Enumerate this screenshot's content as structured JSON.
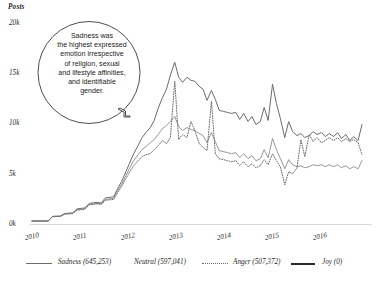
{
  "chart_data": {
    "type": "line",
    "title": "",
    "xlabel": "",
    "ylabel": "Posts",
    "yunit_label": "Posts",
    "ylim": [
      0,
      20000
    ],
    "xlim": [
      2010,
      2016.75
    ],
    "grid": false,
    "legend_position": "bottom",
    "yticks": [
      "0k",
      "5k",
      "10k",
      "15k",
      "20k"
    ],
    "ytick_values": [
      0,
      5000,
      10000,
      15000,
      20000
    ],
    "xticks": [
      "2010",
      "2011",
      "2012",
      "2013",
      "2014",
      "2015",
      "2016"
    ],
    "xtick_values": [
      2010,
      2011,
      2012,
      2013,
      2014,
      2015,
      2016
    ],
    "annotations": [
      {
        "name": "callout",
        "text": "Sadness was the highest expressed emotion irrespective of religion, sexual and lifestyle affinities, and identifiable gender.",
        "lines": [
          "Sadness was",
          "the highest expressed",
          "emotion irrespective",
          "of religion, sexual",
          "and lifestyle affinities,",
          "and identifiable",
          "gender."
        ]
      }
    ],
    "series": [
      {
        "name": "Sadness",
        "label": "Sadness (645,253)",
        "total": 645253,
        "style": "solid",
        "color": "#6b6b6b",
        "width": 1.0,
        "x": [
          2010.0,
          2010.08,
          2010.17,
          2010.25,
          2010.33,
          2010.42,
          2010.5,
          2010.58,
          2010.67,
          2010.75,
          2010.83,
          2010.92,
          2011.0,
          2011.08,
          2011.17,
          2011.25,
          2011.33,
          2011.42,
          2011.5,
          2011.58,
          2011.67,
          2011.75,
          2011.83,
          2011.92,
          2012.0,
          2012.08,
          2012.17,
          2012.25,
          2012.33,
          2012.42,
          2012.5,
          2012.58,
          2012.67,
          2012.75,
          2012.83,
          2012.92,
          2013.0,
          2013.08,
          2013.17,
          2013.25,
          2013.33,
          2013.42,
          2013.5,
          2013.58,
          2013.67,
          2013.75,
          2013.83,
          2013.92,
          2014.0,
          2014.08,
          2014.17,
          2014.25,
          2014.33,
          2014.42,
          2014.5,
          2014.58,
          2014.67,
          2014.75,
          2014.83,
          2014.92,
          2015.0,
          2015.08,
          2015.17,
          2015.25,
          2015.33,
          2015.42,
          2015.5,
          2015.58,
          2015.67,
          2015.75,
          2015.83,
          2015.92,
          2016.0,
          2016.08,
          2016.17,
          2016.25,
          2016.33,
          2016.42,
          2016.5,
          2016.58,
          2016.67,
          2016.75
        ],
        "values": [
          300,
          310,
          300,
          305,
          300,
          760,
          780,
          790,
          1050,
          1080,
          1100,
          1500,
          1550,
          1600,
          2050,
          2100,
          2150,
          2100,
          2600,
          2650,
          2700,
          3500,
          4200,
          5200,
          6100,
          7000,
          7800,
          8600,
          9100,
          9600,
          10300,
          11500,
          12600,
          13400,
          14800,
          16100,
          14600,
          14100,
          14600,
          14300,
          14200,
          13700,
          13400,
          12300,
          13300,
          12400,
          11300,
          11200,
          11100,
          11000,
          11100,
          10400,
          11000,
          10200,
          10700,
          9900,
          10200,
          11600,
          10300,
          13900,
          12000,
          10500,
          8600,
          10200,
          9200,
          8800,
          9000,
          8600,
          8800,
          9200,
          8900,
          9100,
          8700,
          9000,
          8700,
          9100,
          8500,
          8900,
          8300,
          8700,
          8300,
          9900
        ]
      },
      {
        "name": "Neutral",
        "label": "Neutral (597,041)",
        "total": 597041,
        "style": "solid",
        "color": "#8a8a8a",
        "width": 0.9,
        "x": [
          2010.0,
          2010.08,
          2010.17,
          2010.25,
          2010.33,
          2010.42,
          2010.5,
          2010.58,
          2010.67,
          2010.75,
          2010.83,
          2010.92,
          2011.0,
          2011.08,
          2011.17,
          2011.25,
          2011.33,
          2011.42,
          2011.5,
          2011.58,
          2011.67,
          2011.75,
          2011.83,
          2011.92,
          2012.0,
          2012.08,
          2012.17,
          2012.25,
          2012.33,
          2012.42,
          2012.5,
          2012.58,
          2012.67,
          2012.75,
          2012.83,
          2012.92,
          2013.0,
          2013.08,
          2013.17,
          2013.25,
          2013.33,
          2013.42,
          2013.5,
          2013.58,
          2013.67,
          2013.75,
          2013.83,
          2013.92,
          2014.0,
          2014.08,
          2014.17,
          2014.25,
          2014.33,
          2014.42,
          2014.5,
          2014.58,
          2014.67,
          2014.75,
          2014.83,
          2014.92,
          2015.0,
          2015.08,
          2015.17,
          2015.25,
          2015.33,
          2015.42,
          2015.5,
          2015.58,
          2015.67,
          2015.75,
          2015.83,
          2015.92,
          2016.0,
          2016.08,
          2016.17,
          2016.25,
          2016.33,
          2016.42,
          2016.5,
          2016.58,
          2016.67,
          2016.75
        ],
        "values": [
          290,
          300,
          295,
          300,
          295,
          740,
          760,
          770,
          1000,
          1030,
          1060,
          1420,
          1470,
          1520,
          1950,
          2000,
          2050,
          2000,
          2450,
          2500,
          2560,
          3300,
          3900,
          4800,
          5600,
          6300,
          6900,
          7400,
          7700,
          8100,
          8400,
          8900,
          9500,
          9800,
          10200,
          10700,
          9700,
          9300,
          9600,
          9400,
          9300,
          9000,
          8800,
          8100,
          9100,
          8200,
          7300,
          7200,
          7100,
          7000,
          7100,
          6600,
          7000,
          6500,
          6800,
          6300,
          6500,
          7400,
          6600,
          8500,
          7400,
          6500,
          5500,
          6400,
          5900,
          5700,
          5800,
          5600,
          5700,
          5900,
          5800,
          5900,
          5700,
          5900,
          5700,
          5900,
          5600,
          5800,
          5500,
          5700,
          5500,
          6300
        ]
      },
      {
        "name": "Anger",
        "label": "Anger (507,372)",
        "total": 507372,
        "style": "dotted",
        "color": "#6b6b6b",
        "width": 1.0,
        "x": [
          2010.0,
          2010.08,
          2010.17,
          2010.25,
          2010.33,
          2010.42,
          2010.5,
          2010.58,
          2010.67,
          2010.75,
          2010.83,
          2010.92,
          2011.0,
          2011.08,
          2011.17,
          2011.25,
          2011.33,
          2011.42,
          2011.5,
          2011.58,
          2011.67,
          2011.75,
          2011.83,
          2011.92,
          2012.0,
          2012.08,
          2012.17,
          2012.25,
          2012.33,
          2012.42,
          2012.5,
          2012.58,
          2012.67,
          2012.75,
          2012.83,
          2012.92,
          2013.0,
          2013.08,
          2013.17,
          2013.25,
          2013.33,
          2013.42,
          2013.5,
          2013.58,
          2013.67,
          2013.75,
          2013.83,
          2013.92,
          2014.0,
          2014.08,
          2014.17,
          2014.25,
          2014.33,
          2014.42,
          2014.5,
          2014.58,
          2014.67,
          2014.75,
          2014.83,
          2014.92,
          2015.0,
          2015.08,
          2015.17,
          2015.25,
          2015.33,
          2015.42,
          2015.5,
          2015.58,
          2015.67,
          2015.75,
          2015.83,
          2015.92,
          2016.0,
          2016.08,
          2016.17,
          2016.25,
          2016.33,
          2016.42,
          2016.5,
          2016.58,
          2016.67,
          2016.75
        ],
        "values": [
          280,
          290,
          285,
          290,
          285,
          720,
          740,
          750,
          980,
          1000,
          1020,
          1380,
          1420,
          1470,
          1900,
          1950,
          2000,
          1950,
          2350,
          2400,
          2450,
          3100,
          3700,
          4500,
          5200,
          5800,
          6300,
          6700,
          6900,
          7000,
          7400,
          7800,
          8300,
          8000,
          8600,
          14200,
          8400,
          8900,
          8600,
          10200,
          9300,
          8000,
          7600,
          7300,
          12200,
          7000,
          6500,
          6400,
          6300,
          6200,
          6300,
          5800,
          6200,
          5700,
          6000,
          5600,
          5800,
          6400,
          5900,
          7000,
          6300,
          5700,
          3900,
          5200,
          5000,
          5600,
          8400,
          6700,
          8900,
          8200,
          8600,
          8100,
          8300,
          8600,
          8300,
          8600,
          8200,
          8500,
          8200,
          8400,
          8100,
          6900
        ]
      },
      {
        "name": "Joy",
        "label": "Joy (0)",
        "total": 0,
        "style": "solid-thick",
        "color": "#2b2b2b",
        "width": 2.0,
        "x": [],
        "values": []
      }
    ]
  },
  "legend": {
    "items": [
      {
        "label": "Sadness (645,253)",
        "swatch": "solid-thin"
      },
      {
        "label": "Neutral (597,041)",
        "swatch": "none"
      },
      {
        "label": "Anger (507,372)",
        "swatch": "dotted"
      },
      {
        "label": "Joy (0)",
        "swatch": "solid-thick"
      }
    ]
  }
}
